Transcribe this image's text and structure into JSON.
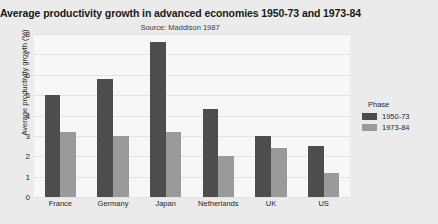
{
  "chart_data": {
    "type": "bar",
    "title": "Average productivity growth in advanced economies 1950-73 and 1973-84",
    "subtitle": "Source: Maddison 1987",
    "xlabel": "",
    "ylabel": "Average productivity growth (%)",
    "ylim": [
      0,
      8
    ],
    "yticks": [
      0,
      1,
      2,
      3,
      4,
      5,
      6,
      7,
      8
    ],
    "grid": true,
    "legend_position": "right",
    "legend_title": "Phase",
    "categories": [
      "France",
      "Germany",
      "Japan",
      "Netherlands",
      "UK",
      "US"
    ],
    "series": [
      {
        "name": "1950-73",
        "color": "#4d4d4d",
        "values": [
          5.0,
          5.8,
          7.6,
          4.3,
          3.0,
          2.5
        ]
      },
      {
        "name": "1973-84",
        "color": "#9a9a9a",
        "values": [
          3.2,
          3.0,
          3.2,
          2.0,
          2.4,
          1.2
        ]
      }
    ]
  },
  "colors": {
    "panel_background": "#f7f7f7",
    "figure_background": "#ebebeb",
    "gridline": "#e2e2e2",
    "text": "#1f1f1f"
  }
}
